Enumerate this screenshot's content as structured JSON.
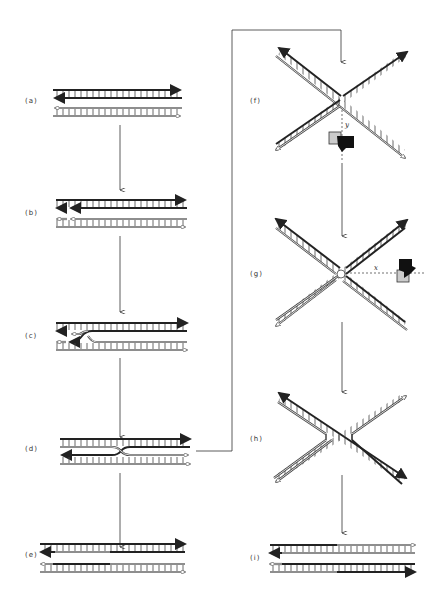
{
  "figure": {
    "panels": [
      {
        "id": "a",
        "label": "(a)"
      },
      {
        "id": "b",
        "label": "(b)"
      },
      {
        "id": "c",
        "label": "(c)"
      },
      {
        "id": "d",
        "label": "(d)"
      },
      {
        "id": "e",
        "label": "(e)"
      },
      {
        "id": "f",
        "label": "(f)"
      },
      {
        "id": "g",
        "label": "(g)"
      },
      {
        "id": "h",
        "label": "(h)"
      },
      {
        "id": "i",
        "label": "(i)"
      }
    ],
    "cut_axes": {
      "f": "y",
      "g": "x"
    },
    "colors": {
      "dark_strand": "#222222",
      "light_strand": "#ffffff",
      "outline": "#444444",
      "line": "#333333"
    }
  }
}
